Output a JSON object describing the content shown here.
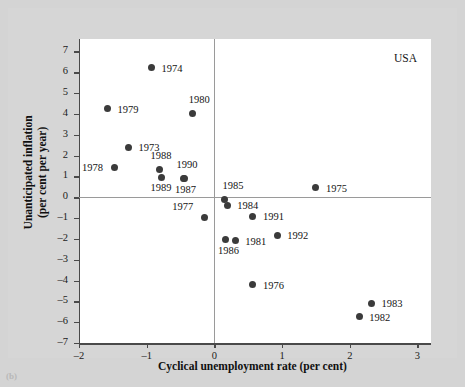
{
  "figure": {
    "country_annotation": "USA",
    "caption": "(b)"
  },
  "chart_data": {
    "type": "scatter",
    "title": "",
    "xlabel": "Cyclical unemployment rate (per cent)",
    "ylabel": "Unanticipated inflation (per cent per year)",
    "xlim": [
      -2,
      3.2
    ],
    "ylim": [
      -7,
      7.6
    ],
    "xticks": [
      -2,
      -1,
      0,
      1,
      2,
      3
    ],
    "xticklabels": [
      "–2",
      "–1",
      "0",
      "1",
      "2",
      "3"
    ],
    "yticks": [
      -7,
      -6,
      -5,
      -4,
      -3,
      -2,
      -1,
      0,
      1,
      2,
      3,
      4,
      5,
      6,
      7
    ],
    "yticklabels": [
      "–7",
      "–6",
      "–5",
      "–4",
      "–3",
      "–2",
      "–1",
      "0",
      "1",
      "2",
      "3",
      "4",
      "5",
      "6",
      "7"
    ],
    "grid": false,
    "legend": null,
    "marker_color": "#3b3b3b",
    "zero_line_color": "#9a9a9a",
    "axis_color": "#4a4a4a",
    "plot_bg": "#ffffff",
    "figure_bg": "#d4d4d4",
    "points": [
      {
        "label": "1973",
        "x": -1.27,
        "y": 2.4,
        "lx": 10,
        "ly": -5
      },
      {
        "label": "1974",
        "x": -0.93,
        "y": 6.23,
        "lx": 10,
        "ly": -5
      },
      {
        "label": "1975",
        "x": 1.5,
        "y": 0.45,
        "lx": 10,
        "ly": -5
      },
      {
        "label": "1976",
        "x": 0.57,
        "y": -4.2,
        "lx": 10,
        "ly": -5
      },
      {
        "label": "1977",
        "x": -0.15,
        "y": -0.95,
        "lx": -32,
        "ly": -16
      },
      {
        "label": "1978",
        "x": -1.47,
        "y": 1.45,
        "lx": -33,
        "ly": -5
      },
      {
        "label": "1979",
        "x": -1.58,
        "y": 4.25,
        "lx": 10,
        "ly": -5
      },
      {
        "label": "1980",
        "x": -0.32,
        "y": 4.03,
        "lx": -4,
        "ly": -19
      },
      {
        "label": "1981",
        "x": 0.31,
        "y": -2.08,
        "lx": 10,
        "ly": -5
      },
      {
        "label": "1982",
        "x": 2.14,
        "y": -5.75,
        "lx": 10,
        "ly": -5
      },
      {
        "label": "1983",
        "x": 2.32,
        "y": -5.1,
        "lx": 10,
        "ly": -5
      },
      {
        "label": "1984",
        "x": 0.19,
        "y": -0.38,
        "lx": 10,
        "ly": -5
      },
      {
        "label": "1985",
        "x": 0.15,
        "y": -0.12,
        "lx": -2,
        "ly": -20
      },
      {
        "label": "1986",
        "x": 0.17,
        "y": -2.05,
        "lx": -8,
        "ly": 5
      },
      {
        "label": "1987",
        "x": -0.45,
        "y": 0.88,
        "lx": -9,
        "ly": 5
      },
      {
        "label": "1988",
        "x": -0.81,
        "y": 1.35,
        "lx": -9,
        "ly": -19
      },
      {
        "label": "1989",
        "x": -0.78,
        "y": 0.95,
        "lx": -11,
        "ly": 5
      },
      {
        "label": "1990",
        "x": -0.44,
        "y": 0.92,
        "lx": -8,
        "ly": -19
      },
      {
        "label": "1991",
        "x": 0.57,
        "y": -0.92,
        "lx": 10,
        "ly": -5
      },
      {
        "label": "1992",
        "x": 0.93,
        "y": -1.83,
        "lx": 10,
        "ly": -5
      }
    ]
  }
}
